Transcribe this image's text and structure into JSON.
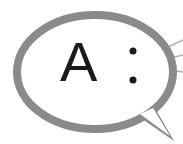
{
  "bubble": {
    "text": "A",
    "separator": ":",
    "stroke_color": "#8a8a8a",
    "fill_color": "#ffffff"
  }
}
